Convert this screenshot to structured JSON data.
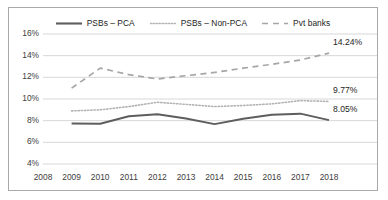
{
  "chart_data": {
    "type": "line",
    "title": "",
    "xlabel": "",
    "ylabel": "",
    "x": [
      2008,
      2009,
      2010,
      2011,
      2012,
      2013,
      2014,
      2015,
      2016,
      2017,
      2018
    ],
    "xtick_labels": [
      "2008",
      "2009",
      "2010",
      "2011",
      "2012",
      "2013",
      "2014",
      "2015",
      "2016",
      "2017",
      "2018"
    ],
    "ytick_labels": [
      "4%",
      "6%",
      "8%",
      "10%",
      "12%",
      "14%",
      "16%"
    ],
    "yticks": [
      4,
      6,
      8,
      10,
      12,
      14,
      16
    ],
    "ylim": [
      4,
      16
    ],
    "grid": true,
    "legend_position": "top-center",
    "series": [
      {
        "name": "PSBs – PCA",
        "style": "solid",
        "color": "#5e5e5e",
        "x": [
          2009,
          2010,
          2011,
          2012,
          2013,
          2014,
          2015,
          2016,
          2017,
          2018
        ],
        "values": [
          7.75,
          7.72,
          8.4,
          8.6,
          8.2,
          7.68,
          8.18,
          8.55,
          8.65,
          8.05
        ],
        "end_label": "8.05%"
      },
      {
        "name": "PSBs – Non-PCA",
        "style": "dotted",
        "color": "#b2b2b2",
        "x": [
          2009,
          2010,
          2011,
          2012,
          2013,
          2014,
          2015,
          2016,
          2017,
          2018
        ],
        "values": [
          8.9,
          9.0,
          9.3,
          9.7,
          9.5,
          9.3,
          9.4,
          9.55,
          9.85,
          9.77
        ],
        "end_label": "9.77%"
      },
      {
        "name": "Pvt banks",
        "style": "dashed",
        "color": "#a6a6a6",
        "x": [
          2009,
          2010,
          2011,
          2012,
          2013,
          2014,
          2015,
          2016,
          2017,
          2018
        ],
        "values": [
          11.0,
          12.85,
          12.25,
          11.85,
          12.15,
          12.45,
          12.85,
          13.2,
          13.6,
          14.24
        ],
        "end_label": "14.24%"
      }
    ],
    "data_labels": [
      {
        "text": "14.24%",
        "series": "Pvt banks"
      },
      {
        "text": "9.77%",
        "series": "PSBs – Non-PCA"
      },
      {
        "text": "8.05%",
        "series": "PSBs – PCA"
      }
    ]
  },
  "colors": {
    "frame_border": "#a9a9a9",
    "gridline": "#d2d2d2",
    "axis_text": "#3d3d3d",
    "label_text": "#1d1d1d",
    "background": "#ffffff"
  }
}
